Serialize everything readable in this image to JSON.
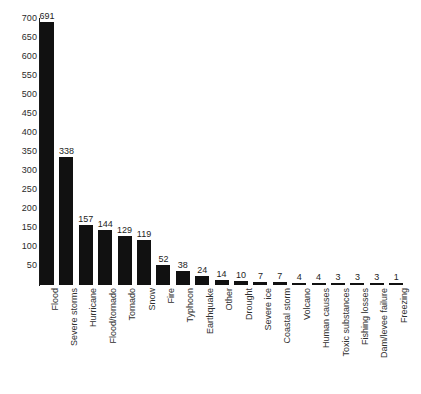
{
  "chart_data": {
    "type": "bar",
    "title": "",
    "subtitle": "",
    "xlabel": "",
    "ylabel": "",
    "ylim": [
      0,
      700
    ],
    "grid": false,
    "legend": false,
    "orientation": "vertical",
    "bar_color": "#111111",
    "axis_color": "#1a1a1a",
    "text_color": "#2b2b2b",
    "y_ticks": [
      50,
      100,
      150,
      200,
      250,
      300,
      350,
      400,
      450,
      500,
      550,
      600,
      650,
      700
    ],
    "y_tick_labels": [
      "50",
      "100",
      "150",
      "200",
      "250",
      "300",
      "350",
      "400",
      "450",
      "500",
      "550",
      "600",
      "650",
      "700"
    ],
    "categories": [
      "Flood",
      "Severe storms",
      "Hurricane",
      "Flood/tornado",
      "Tornado",
      "Snow",
      "Fire",
      "Typhoon",
      "Earthquake",
      "Other",
      "Drought",
      "Severe ice",
      "Coastal storm",
      "Volcano",
      "Human causes",
      "Toxic substances",
      "Fishing losses",
      "Dam/levee failure",
      "Freezing"
    ],
    "values": [
      691,
      338,
      157,
      144,
      129,
      119,
      52,
      38,
      24,
      14,
      10,
      7,
      7,
      4,
      4,
      3,
      3,
      3,
      1
    ],
    "value_labels": [
      "691",
      "338",
      "157",
      "144",
      "129",
      "119",
      "52",
      "38",
      "24",
      "14",
      "10",
      "7",
      "7",
      "4",
      "4",
      "3",
      "3",
      "3",
      "1"
    ]
  }
}
